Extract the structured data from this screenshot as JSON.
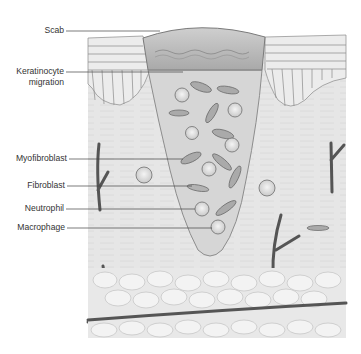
{
  "diagram": {
    "labels": [
      {
        "id": "scab",
        "text": "Scab"
      },
      {
        "id": "keratinocyte",
        "line1": "Keratinocyte",
        "line2": "migration"
      },
      {
        "id": "myofibroblast",
        "text": "Myofibroblast"
      },
      {
        "id": "fibroblast",
        "text": "Fibroblast"
      },
      {
        "id": "neutrophil",
        "text": "Neutrophil"
      },
      {
        "id": "macrophage",
        "text": "Macrophage"
      }
    ],
    "colors": {
      "background": "#ffffff",
      "tissue": "#e9e9e9",
      "dermis": "#e4e4e4",
      "wound": "#d4d4d4",
      "scab": "#b8b8b8",
      "cell_outline": "#777777",
      "vessel": "#555555",
      "fat": "#efefef",
      "leader": "#444444",
      "text": "#333333"
    }
  }
}
